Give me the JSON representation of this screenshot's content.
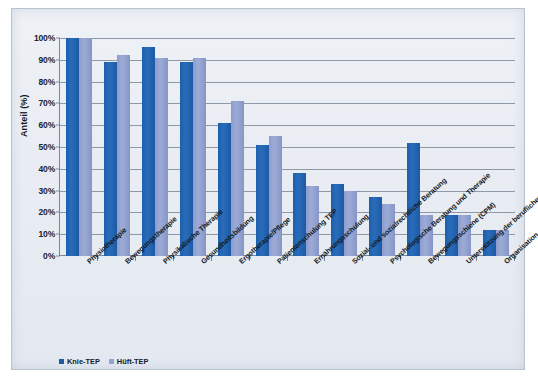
{
  "chart_data": {
    "type": "bar",
    "title": "",
    "xlabel": "",
    "ylabel": "Anteil (%)",
    "ylim": [
      0,
      100
    ],
    "grid": true,
    "legend_position": "bottom-left",
    "ytick_labels": [
      "100%",
      "90%",
      "80%",
      "70%",
      "60%",
      "50%",
      "40%",
      "30%",
      "20%",
      "10%",
      "0%"
    ],
    "ytick_values": [
      100,
      90,
      80,
      70,
      60,
      50,
      40,
      30,
      20,
      10,
      0
    ],
    "categories": [
      "Physiotherapie",
      "Bewegungstherapie",
      "Physikalische Therapie",
      "Gesundheitsbildung",
      "Ergotherapie/Pflege",
      "Patientenschulung TEP",
      "Ernährungsschulung",
      "Sozial- und sozialrechtliche Beratung",
      "Psychologische Beratung und Therapie",
      "Bewegungsschiene (CPM)",
      "Unterstützung der beruflichen Integration",
      "Organisation der Nachsorge"
    ],
    "series": [
      {
        "name": "Knie-TEP",
        "color": "#1d5aa4",
        "values": [
          100,
          89,
          96,
          89,
          61,
          51,
          38,
          33,
          27,
          52,
          19,
          12
        ]
      },
      {
        "name": "Hüft-TEP",
        "color": "#93a2d0",
        "values": [
          100,
          92,
          91,
          91,
          71,
          55,
          32,
          30,
          24,
          19,
          19,
          12
        ]
      }
    ]
  },
  "legend": {
    "items": [
      {
        "label": "Knie-TEP",
        "color": "#1d5aa4"
      },
      {
        "label": "Hüft-TEP",
        "color": "#93a2d0"
      }
    ]
  }
}
